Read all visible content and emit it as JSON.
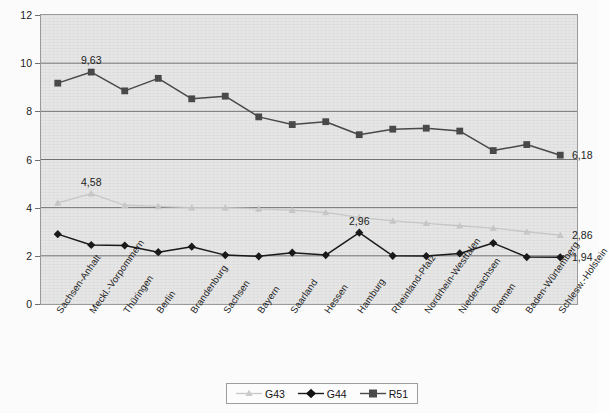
{
  "chart_data": {
    "type": "line",
    "title": "",
    "subtitle": "",
    "xlabel": "",
    "ylabel": "",
    "ylim": [
      0,
      12
    ],
    "ytick_step": 2,
    "yticks": [
      "0",
      "2",
      "4",
      "6",
      "8",
      "10",
      "12"
    ],
    "grid": true,
    "grid_axis": "y",
    "legend_position": "bottom-center",
    "categories": [
      "Sachsen-Anhalt",
      "Meckl.-Vorpommern",
      "Thüringen",
      "Berlin",
      "Brandenburg",
      "Sachsen",
      "Bayern",
      "Saarland",
      "Hessen",
      "Hamburg",
      "Rheinland-Pfalz",
      "Nordrhein-Westfalen",
      "Niedersachsen",
      "Bremen",
      "Baden-Würtemberg",
      "Schlesw.-Holstein"
    ],
    "series": [
      {
        "name": "G43",
        "color": "#c9c9c9",
        "marker": "triangle",
        "values": [
          4.2,
          4.58,
          4.1,
          4.05,
          4.0,
          4.0,
          3.95,
          3.9,
          3.8,
          3.6,
          3.45,
          3.35,
          3.25,
          3.15,
          3.0,
          2.86
        ]
      },
      {
        "name": "G44",
        "color": "#1a1a1a",
        "marker": "diamond",
        "values": [
          2.9,
          2.45,
          2.43,
          2.15,
          2.38,
          2.03,
          1.98,
          2.13,
          2.03,
          2.96,
          2.0,
          1.99,
          2.1,
          2.53,
          1.95,
          1.94
        ]
      },
      {
        "name": "R51",
        "color": "#4a4a4a",
        "marker": "square",
        "values": [
          9.17,
          9.63,
          8.85,
          9.37,
          8.52,
          8.63,
          7.77,
          7.45,
          7.57,
          7.03,
          7.26,
          7.3,
          7.18,
          6.37,
          6.62,
          6.18
        ]
      }
    ],
    "point_labels": [
      {
        "series": "R51",
        "index": 1,
        "text": "9,63"
      },
      {
        "series": "R51",
        "index": 15,
        "text": "6,18"
      },
      {
        "series": "G43",
        "index": 1,
        "text": "4,58"
      },
      {
        "series": "G43",
        "index": 15,
        "text": "2,86"
      },
      {
        "series": "G44",
        "index": 9,
        "text": "2,96"
      },
      {
        "series": "G44",
        "index": 15,
        "text": "1,94"
      }
    ]
  },
  "legend": {
    "items": [
      {
        "label": "G43"
      },
      {
        "label": "G44"
      },
      {
        "label": "R51"
      }
    ]
  }
}
